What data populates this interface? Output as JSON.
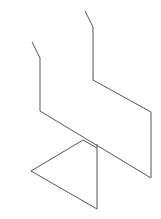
{
  "drawing": {
    "width": 161,
    "height": 219,
    "background": "#ffffff",
    "stroke_color": "#555555",
    "stroke_width": 1,
    "subject": "line-drawing-chair",
    "paths": [
      {
        "name": "back-left-leg-and-seat-edge",
        "points": "32,42 40,58 40,111 151,178 151,112 93,80 93,27 85,11"
      },
      {
        "name": "front-leg-triangle",
        "points": "97,144 97,209 31,171 83,140 97,148"
      }
    ]
  }
}
